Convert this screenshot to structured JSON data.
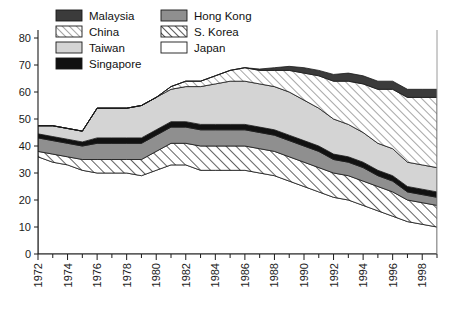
{
  "legend": {
    "position": "top-left-overlay",
    "columns": 2,
    "items": [
      {
        "label": "Malaysia",
        "swatch": "solid",
        "color": "#3b3b3b",
        "name": "legend-swatch-malaysia"
      },
      {
        "label": "Hong Kong",
        "swatch": "solid",
        "color": "#8f8f8f",
        "name": "legend-swatch-hong-kong"
      },
      {
        "label": "China",
        "swatch": "hatch",
        "color": "#ffffff",
        "name": "legend-swatch-china"
      },
      {
        "label": "S. Korea",
        "swatch": "hatch2",
        "color": "#ffffff",
        "name": "legend-swatch-s-korea"
      },
      {
        "label": "Taiwan",
        "swatch": "solid",
        "color": "#d4d4d4",
        "name": "legend-swatch-taiwan"
      },
      {
        "label": "Japan",
        "swatch": "solid",
        "color": "#ffffff",
        "name": "legend-swatch-japan"
      },
      {
        "label": "Singapore",
        "swatch": "solid",
        "color": "#111111",
        "name": "legend-swatch-singapore"
      }
    ]
  },
  "axes": {
    "y_ticks": [
      0,
      10,
      20,
      30,
      40,
      50,
      60,
      70,
      80
    ],
    "ylim": [
      0,
      80
    ],
    "xlim": [
      1972,
      1999
    ],
    "x_ticks": [
      1972,
      1974,
      1976,
      1978,
      1980,
      1982,
      1984,
      1986,
      1988,
      1990,
      1992,
      1994,
      1996,
      1998
    ],
    "x_minor_step": 1,
    "ylabel": "",
    "xlabel": "",
    "grid": false
  },
  "chart_data": {
    "type": "area",
    "stacked": true,
    "title": "",
    "xlabel": "",
    "ylabel": "",
    "ylim": [
      0,
      80
    ],
    "xlim": [
      1972,
      1999
    ],
    "grid": false,
    "legend_position": "top-left",
    "x": [
      1972,
      1973,
      1974,
      1975,
      1976,
      1977,
      1978,
      1979,
      1980,
      1981,
      1982,
      1983,
      1984,
      1985,
      1986,
      1987,
      1988,
      1989,
      1990,
      1991,
      1992,
      1993,
      1994,
      1995,
      1996,
      1997,
      1998,
      1999
    ],
    "stack_order_bottom_to_top": [
      "Japan",
      "S. Korea",
      "Hong Kong",
      "Singapore",
      "Taiwan",
      "China",
      "Malaysia"
    ],
    "series": [
      {
        "name": "Japan",
        "fill": "#ffffff",
        "pattern": "solid",
        "values": [
          36,
          34,
          33,
          31,
          30,
          30,
          30,
          29,
          31,
          33,
          33,
          31,
          31,
          31,
          31,
          30,
          29,
          27,
          25,
          23,
          21,
          20,
          18,
          16,
          14,
          12,
          11,
          10
        ]
      },
      {
        "name": "S. Korea",
        "fill": "#ffffff",
        "pattern": "hatch-wide",
        "values": [
          2,
          3,
          3,
          4,
          5,
          5,
          5,
          6,
          7,
          8,
          8,
          9,
          9,
          9,
          9,
          9,
          9,
          9,
          9,
          9,
          9,
          9,
          9,
          9,
          9,
          8,
          8,
          8
        ]
      },
      {
        "name": "Hong Kong",
        "fill": "#8f8f8f",
        "pattern": "solid",
        "values": [
          5,
          5,
          5,
          5,
          6,
          6,
          6,
          6,
          6,
          6,
          6,
          6,
          6,
          6,
          6,
          6,
          6,
          6,
          6,
          6,
          5,
          5,
          5,
          4,
          4,
          3,
          3,
          3
        ]
      },
      {
        "name": "Singapore",
        "fill": "#111111",
        "pattern": "solid",
        "values": [
          1.5,
          1.5,
          1.5,
          1.5,
          2,
          2,
          2,
          2,
          2,
          2,
          2,
          2,
          2,
          2,
          2,
          2,
          2,
          2,
          2,
          2,
          2,
          2,
          2,
          2,
          2,
          2,
          2,
          2
        ]
      },
      {
        "name": "Taiwan",
        "fill": "#d4d4d4",
        "pattern": "solid",
        "values": [
          3,
          4,
          4,
          4,
          11,
          11,
          11,
          12,
          12,
          12,
          13,
          14,
          15,
          16,
          16,
          16,
          16,
          16,
          15,
          14,
          13,
          12,
          11,
          10,
          10,
          9,
          9,
          9
        ]
      },
      {
        "name": "China",
        "fill": "#ffffff",
        "pattern": "hatch-fine",
        "values": [
          0,
          0,
          0,
          0,
          0,
          0,
          0,
          0,
          0,
          1,
          2,
          2,
          3,
          4,
          5,
          5,
          6,
          8,
          10,
          12,
          14,
          16,
          18,
          20,
          22,
          24,
          25,
          26
        ]
      },
      {
        "name": "Malaysia",
        "fill": "#3b3b3b",
        "pattern": "solid",
        "values": [
          0,
          0,
          0,
          0,
          0,
          0,
          0,
          0,
          0,
          0,
          0,
          0,
          0,
          0,
          0,
          0.5,
          1,
          1.5,
          2,
          2,
          2.5,
          3,
          3,
          3,
          3,
          3,
          3,
          3
        ]
      }
    ],
    "totals": [
      47.5,
      47.5,
      46.5,
      45.5,
      54,
      54,
      54,
      55,
      58,
      62,
      64,
      64,
      66,
      68,
      69,
      68.5,
      69,
      69.5,
      69,
      68,
      66.5,
      67,
      66,
      64,
      64,
      61,
      58,
      58
    ]
  }
}
